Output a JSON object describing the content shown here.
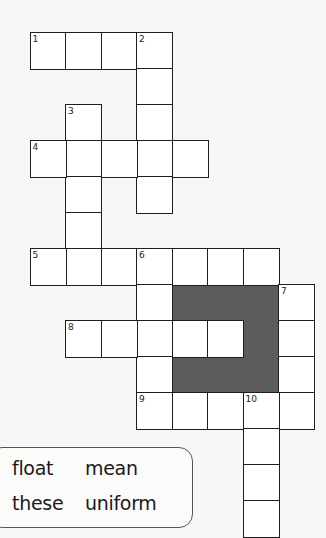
{
  "puzzle": {
    "type": "crossword",
    "cell_size": 35.5,
    "origin": {
      "x": 29.5,
      "y": 32
    },
    "row_height": 36,
    "colors": {
      "grid_line": "#1e1e1e",
      "cell_bg": "#ffffff",
      "shaded": "#5c5c5c",
      "page_bg": "#f7f7f5"
    },
    "clue_numbers": [
      {
        "n": "1",
        "row": 0,
        "col": 0
      },
      {
        "n": "2",
        "row": 0,
        "col": 3
      },
      {
        "n": "3",
        "row": 2,
        "col": 1
      },
      {
        "n": "4",
        "row": 3,
        "col": 0
      },
      {
        "n": "5",
        "row": 6,
        "col": 0
      },
      {
        "n": "6",
        "row": 6,
        "col": 3
      },
      {
        "n": "7",
        "row": 7,
        "col": 7
      },
      {
        "n": "8",
        "row": 8,
        "col": 1
      },
      {
        "n": "9",
        "row": 10,
        "col": 3
      },
      {
        "n": "10",
        "row": 10,
        "col": 6
      }
    ],
    "entries": [
      {
        "n": "1",
        "dir": "across",
        "row": 0,
        "col": 0,
        "len": 4
      },
      {
        "n": "2",
        "dir": "down",
        "row": 0,
        "col": 3,
        "len": 5
      },
      {
        "n": "3",
        "dir": "down",
        "row": 2,
        "col": 1,
        "len": 5
      },
      {
        "n": "4",
        "dir": "across",
        "row": 3,
        "col": 0,
        "len": 5
      },
      {
        "n": "5",
        "dir": "across",
        "row": 6,
        "col": 0,
        "len": 7
      },
      {
        "n": "6",
        "dir": "down",
        "row": 6,
        "col": 3,
        "len": 5
      },
      {
        "n": "7",
        "dir": "down",
        "row": 7,
        "col": 7,
        "len": 4
      },
      {
        "n": "8",
        "dir": "across",
        "row": 8,
        "col": 1,
        "len": 5
      },
      {
        "n": "9",
        "dir": "across",
        "row": 10,
        "col": 3,
        "len": 5
      },
      {
        "n": "10",
        "dir": "down",
        "row": 10,
        "col": 6,
        "len": 4
      }
    ]
  },
  "word_bank": {
    "words": [
      "float",
      "mean",
      "these",
      "uniform"
    ]
  }
}
